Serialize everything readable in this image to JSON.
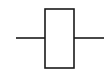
{
  "diagram": {
    "symbol": "resistor-icon",
    "style": "IEC rectangular",
    "stroke_color": "#1a1a1a",
    "background": "#ffffff",
    "body": {
      "x": 45,
      "y": 9,
      "width": 29,
      "height": 59
    },
    "left_lead": {
      "x1": 16,
      "x2": 45,
      "y": 38
    },
    "right_lead": {
      "x1": 74,
      "x2": 104,
      "y": 38
    }
  }
}
